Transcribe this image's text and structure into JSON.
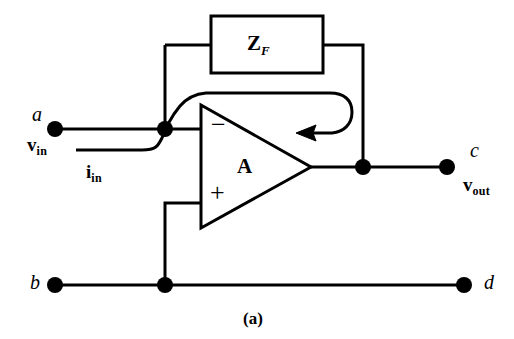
{
  "figure": {
    "caption": "(a)",
    "type": "operational-amplifier-inverting-feedback-circuit",
    "colors": {
      "ink": "#000000",
      "background": "#ffffff"
    }
  },
  "blocks": {
    "feedback_impedance": {
      "label_main": "Z",
      "label_sub": "F",
      "name": "feedback impedance block"
    },
    "amplifier": {
      "gain_label": "A",
      "inverting_sign": "−",
      "noninverting_sign": "+"
    }
  },
  "terminals": [
    {
      "id": "a",
      "label": "a",
      "role": "input-top-left"
    },
    {
      "id": "b",
      "label": "b",
      "role": "input-bottom-left"
    },
    {
      "id": "c",
      "label": "c",
      "role": "output-top-right"
    },
    {
      "id": "d",
      "label": "d",
      "role": "output-bottom-right"
    }
  ],
  "quantities": {
    "input_voltage": {
      "main": "v",
      "sub": "in"
    },
    "input_current": {
      "main": "i",
      "sub": "in"
    },
    "output_voltage": {
      "main": "v",
      "sub": "out"
    }
  }
}
